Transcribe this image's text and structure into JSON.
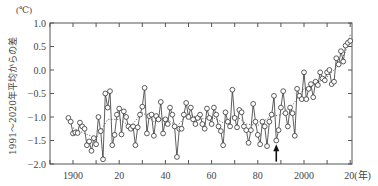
{
  "chart_data": {
    "type": "line",
    "title": "",
    "y_unit": "(℃)",
    "ylabel": "1991～2020年平均からの差",
    "x_unit": "(年)",
    "xlabel": "",
    "ylim": [
      -2.0,
      1.0
    ],
    "xlim": [
      1890,
      2021
    ],
    "y_ticks": [
      1.0,
      0.5,
      0.0,
      -0.5,
      -1.0,
      -1.5,
      -2.0
    ],
    "y_tick_labels": [
      "1.0",
      "0.5",
      "0.0",
      "−0.5",
      "−1.0",
      "−1.5",
      "−2.0"
    ],
    "x_ticks": [
      1900,
      1920,
      1940,
      1960,
      1980,
      2000,
      2020
    ],
    "x_tick_labels": [
      "1900",
      "20",
      "40",
      "60",
      "80",
      "2000",
      "20(年)"
    ],
    "x_minor_ticks": [
      1890,
      1910,
      1930,
      1950,
      1970,
      1990,
      2010
    ],
    "grid": false,
    "legend": [],
    "annotations": [
      {
        "type": "arrow",
        "x": 1988,
        "direction": "up",
        "y_from": -1.95,
        "y_to": -1.62
      }
    ],
    "series": [
      {
        "name": "annual anomaly",
        "style": "line-with-open-circles",
        "x": [
          1898,
          1899,
          1900,
          1901,
          1902,
          1903,
          1904,
          1905,
          1906,
          1907,
          1908,
          1909,
          1910,
          1911,
          1912,
          1913,
          1914,
          1915,
          1916,
          1917,
          1918,
          1919,
          1920,
          1921,
          1922,
          1923,
          1924,
          1925,
          1926,
          1927,
          1928,
          1929,
          1930,
          1931,
          1932,
          1933,
          1934,
          1935,
          1936,
          1937,
          1938,
          1939,
          1940,
          1941,
          1942,
          1943,
          1944,
          1945,
          1946,
          1947,
          1948,
          1949,
          1950,
          1951,
          1952,
          1953,
          1954,
          1955,
          1956,
          1957,
          1958,
          1959,
          1960,
          1961,
          1962,
          1963,
          1964,
          1965,
          1966,
          1967,
          1968,
          1969,
          1970,
          1971,
          1972,
          1973,
          1974,
          1975,
          1976,
          1977,
          1978,
          1979,
          1980,
          1981,
          1982,
          1983,
          1984,
          1985,
          1986,
          1987,
          1988,
          1989,
          1990,
          1991,
          1992,
          1993,
          1994,
          1995,
          1996,
          1997,
          1998,
          1999,
          2000,
          2001,
          2002,
          2003,
          2004,
          2005,
          2006,
          2007,
          2008,
          2009,
          2010,
          2011,
          2012,
          2013,
          2014,
          2015,
          2016,
          2017,
          2018,
          2019,
          2020
        ],
        "values": [
          -1.02,
          -1.1,
          -1.35,
          -1.33,
          -1.34,
          -1.12,
          -1.2,
          -1.25,
          -1.6,
          -1.52,
          -1.72,
          -1.45,
          -1.58,
          -1.0,
          -1.3,
          -1.9,
          -0.5,
          -0.8,
          -0.45,
          -1.6,
          -1.38,
          -0.95,
          -0.82,
          -1.37,
          -0.88,
          -1.0,
          -1.2,
          -1.25,
          -1.2,
          -1.6,
          -1.22,
          -0.95,
          -0.78,
          -0.38,
          -1.35,
          -0.98,
          -0.95,
          -1.4,
          -0.98,
          -1.05,
          -0.68,
          -1.35,
          -1.05,
          -1.15,
          -0.8,
          -0.95,
          -1.2,
          -1.85,
          -1.25,
          -1.25,
          -0.95,
          -0.7,
          -1.0,
          -0.8,
          -1.05,
          -1.15,
          -1.02,
          -0.95,
          -1.15,
          -1.25,
          -0.82,
          -1.02,
          -1.15,
          -0.8,
          -0.95,
          -1.2,
          -1.3,
          -1.6,
          -0.9,
          -1.1,
          -1.2,
          -0.42,
          -1.02,
          -1.22,
          -0.85,
          -0.9,
          -1.2,
          -1.28,
          -1.55,
          -1.28,
          -0.72,
          -1.1,
          -1.38,
          -1.58,
          -1.1,
          -1.2,
          -1.62,
          -1.1,
          -0.95,
          -0.55,
          -1.5,
          -1.28,
          -0.8,
          -0.45,
          -0.92,
          -1.2,
          -0.8,
          -0.92,
          -1.4,
          -0.4,
          -0.55,
          -0.62,
          -0.05,
          -0.62,
          -0.4,
          -0.3,
          -0.58,
          -0.25,
          -0.32,
          -0.05,
          -0.18,
          -0.22,
          -0.05,
          0.0,
          -0.3,
          -0.25,
          0.25,
          0.12,
          0.4,
          0.18,
          0.52,
          0.58,
          0.62
        ],
        "color": "#333333",
        "marker": "circle-open"
      },
      {
        "name": "5-year running mean",
        "style": "dotted",
        "x": [
          1900,
          1905,
          1910,
          1915,
          1920,
          1925,
          1930,
          1935,
          1940,
          1945,
          1950,
          1955,
          1960,
          1965,
          1970,
          1975,
          1980,
          1985,
          1990,
          1995,
          2000,
          2005,
          2010,
          2015,
          2018,
          2020
        ],
        "values": [
          -1.23,
          -1.35,
          -1.45,
          -1.05,
          -1.05,
          -1.2,
          -0.9,
          -1.1,
          -1.02,
          -1.2,
          -0.92,
          -1.05,
          -1.0,
          -1.12,
          -0.95,
          -1.15,
          -1.18,
          -1.0,
          -0.95,
          -0.75,
          -0.4,
          -0.3,
          -0.15,
          0.1,
          0.4,
          0.75
        ],
        "color": "#555555"
      }
    ]
  }
}
